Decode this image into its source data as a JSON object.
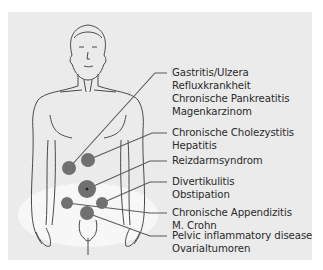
{
  "figure": {
    "background_color": "#ebebeb",
    "line_color": "#555555",
    "marker_color": "#6f6f6f"
  },
  "labels": [
    {
      "lines": [
        "Gastritis/Ulzera",
        "Refluxkrankheit",
        "Chronische Pankreatitis",
        "Magenkarzinom"
      ]
    },
    {
      "lines": [
        "Chronische Cholezystitis",
        "Hepatitis"
      ]
    },
    {
      "lines": [
        "Reizdarmsyndrom"
      ]
    },
    {
      "lines": [
        "Divertikulitis",
        "Obstipation"
      ]
    },
    {
      "lines": [
        "Chronische Appendizitis",
        "M. Crohn"
      ]
    },
    {
      "lines": [
        "Pelvic inflammatory disease",
        "Ovarialtumoren"
      ]
    }
  ]
}
